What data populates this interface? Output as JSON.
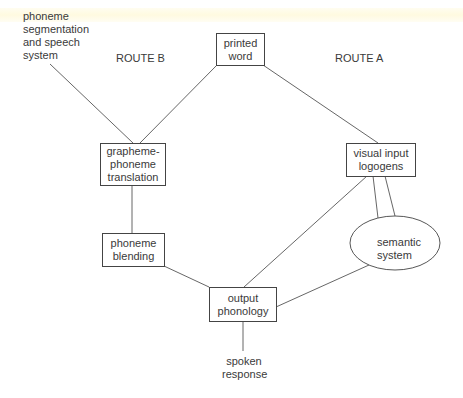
{
  "diagram": {
    "type": "dual-route reading model",
    "route_labels": {
      "route_b": "ROUTE B",
      "route_a": "ROUTE A"
    },
    "nodes": {
      "phoneme_segmentation": {
        "label": "phoneme\nsegmentation\nand speech\nsystem",
        "shape": "text"
      },
      "printed_word": {
        "label": "printed\nword",
        "shape": "box"
      },
      "grapheme_phoneme": {
        "label": "grapheme-\nphoneme\ntranslation",
        "shape": "box"
      },
      "visual_input_logogens": {
        "label": "visual input\nlogogens",
        "shape": "box"
      },
      "phoneme_blending": {
        "label": "phoneme\nblending",
        "shape": "box"
      },
      "semantic_system": {
        "label": "semantic\nsystem",
        "shape": "ellipse"
      },
      "output_phonology": {
        "label": "output\nphonology",
        "shape": "box"
      },
      "spoken_response": {
        "label": "spoken\nresponse",
        "shape": "text"
      }
    },
    "edges": [
      [
        "phoneme_segmentation",
        "grapheme_phoneme"
      ],
      [
        "printed_word",
        "grapheme_phoneme"
      ],
      [
        "printed_word",
        "visual_input_logogens"
      ],
      [
        "grapheme_phoneme",
        "phoneme_blending"
      ],
      [
        "phoneme_blending",
        "output_phonology"
      ],
      [
        "visual_input_logogens",
        "output_phonology"
      ],
      [
        "visual_input_logogens",
        "semantic_system",
        "double"
      ],
      [
        "semantic_system",
        "output_phonology"
      ],
      [
        "output_phonology",
        "spoken_response"
      ]
    ],
    "colors": {
      "line": "#444444",
      "text": "#3a3a3a",
      "background": "#ffffff"
    }
  }
}
